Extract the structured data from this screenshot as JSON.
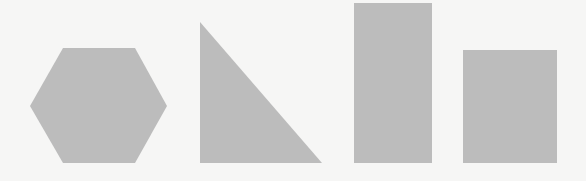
{
  "canvas": {
    "width": 586,
    "height": 181,
    "background": "#f6f6f5"
  },
  "fill_color": "#bcbcbc",
  "shapes": [
    {
      "name": "hexagon",
      "points": "63,48 135,48 167,106 135,163 63,163 30,106"
    },
    {
      "name": "right-triangle",
      "points": "200,22 200,163 322,163"
    },
    {
      "name": "tall-rectangle",
      "x": 354,
      "y": 3,
      "width": 78,
      "height": 160
    },
    {
      "name": "square",
      "x": 463,
      "y": 50,
      "width": 94,
      "height": 113
    }
  ]
}
